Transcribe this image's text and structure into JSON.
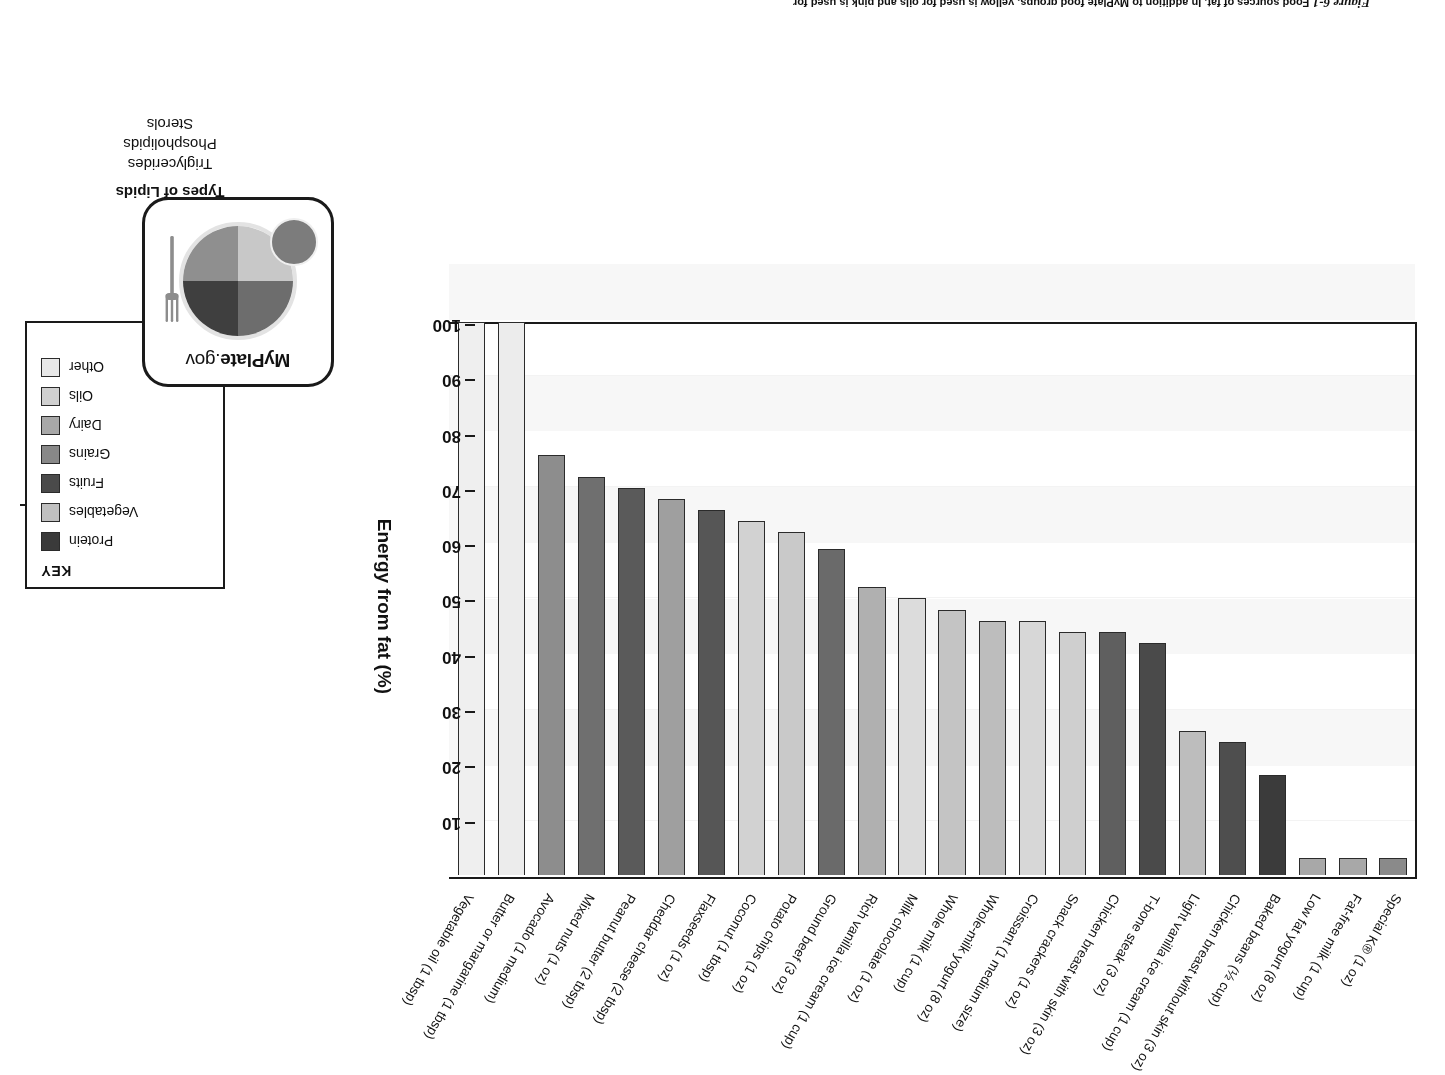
{
  "caption": {
    "figure_number": "Figure 6-1",
    "text": "Food sources of fat. In addition to MyPlate food groups, yellow is used for oils and pink is used for"
  },
  "chart_data": {
    "type": "bar",
    "title": "Food sources of fat",
    "xlabel": "",
    "ylabel": "Energy from fat (%)",
    "ylim": [
      0,
      100
    ],
    "yticks": [
      10,
      20,
      30,
      40,
      50,
      60,
      70,
      80,
      90,
      100
    ],
    "grid": true,
    "legend_position": "right",
    "categories": [
      "Special K® (1 oz)",
      "Fat-free milk (1 cup)",
      "Low fat yogurt (8 oz)",
      "Baked beans (½ cup)",
      "Chicken breast without skin (3 oz)",
      "Light vanilla ice cream (1 cup)",
      "T-bone steak (3 oz)",
      "Chicken breast with skin (3 oz)",
      "Snack crackers (1 oz)",
      "Croissant (1 medium size)",
      "Whole-milk yogurt (8 oz)",
      "Whole milk (1 cup)",
      "Milk chocolate (1 oz)",
      "Rich vanilla ice cream (1 cup)",
      "Ground beef (3 oz)",
      "Potato chips (1 oz)",
      "Coconut (1 tbsp)",
      "Flaxseeds (1 oz)",
      "Cheddar cheese (2 tbsp)",
      "Peanut butter (2 tbsp)",
      "Mixed nuts (1 oz)",
      "Avocado (1 medium)",
      "Butter or margarine (1 tbsp)",
      "Vegetable oil (1 tbsp)"
    ],
    "values": [
      3,
      3,
      3,
      18,
      24,
      26,
      42,
      44,
      44,
      46,
      46,
      48,
      50,
      52,
      59,
      62,
      64,
      66,
      68,
      70,
      72,
      76,
      100,
      100
    ],
    "bar_groups": [
      "Grains",
      "Dairy",
      "Dairy",
      "Vegetables",
      "Protein",
      "Dairy",
      "Protein",
      "Protein",
      "Grains",
      "Grains",
      "Dairy",
      "Dairy",
      "Other",
      "Dairy",
      "Protein",
      "Other",
      "Other",
      "Protein",
      "Dairy",
      "Protein",
      "Protein",
      "Fruits",
      "Oils",
      "Oils"
    ],
    "bar_colors": [
      "#8a8a8a",
      "#a8a8a8",
      "#a8a8a8",
      "#3b3b3b",
      "#4e4e4e",
      "#bdbdbd",
      "#4a4a4a",
      "#5f5f5f",
      "#cfcfcf",
      "#d7d7d7",
      "#bdbdbd",
      "#c4c4c4",
      "#dcdcdc",
      "#b0b0b0",
      "#6a6a6a",
      "#c9c9c9",
      "#d2d2d2",
      "#565656",
      "#9f9f9f",
      "#5a5a5a",
      "#6f6f6f",
      "#8d8d8d",
      "#ececec",
      "#efefef"
    ]
  },
  "key": {
    "title": "KEY",
    "items": [
      {
        "label": "Protein",
        "color": "#3a3a3a"
      },
      {
        "label": "Vegetables",
        "color": "#c0c0c0"
      },
      {
        "label": "Fruits",
        "color": "#4a4a4a"
      },
      {
        "label": "Grains",
        "color": "#888888"
      },
      {
        "label": "Dairy",
        "color": "#a8a8a8"
      },
      {
        "label": "Oils",
        "color": "#d0d0d0"
      },
      {
        "label": "Other",
        "color": "#e8e8e8"
      }
    ]
  },
  "myplate": {
    "brand_bold": "MyPlate",
    "brand_rest": ".gov"
  },
  "lipids": {
    "title": "Types of Lipids",
    "items": [
      "Triglycerides",
      "Phospholipids",
      "Sterols"
    ]
  }
}
